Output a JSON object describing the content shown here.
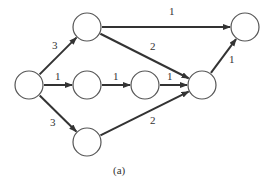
{
  "caption": "(a)",
  "nodes": [
    {
      "id": "S",
      "cx": 29,
      "cy": 85
    },
    {
      "id": "A",
      "cx": 87,
      "cy": 27
    },
    {
      "id": "B",
      "cx": 87,
      "cy": 85
    },
    {
      "id": "C",
      "cx": 145,
      "cy": 85
    },
    {
      "id": "D",
      "cx": 87,
      "cy": 142
    },
    {
      "id": "E",
      "cx": 202,
      "cy": 85
    },
    {
      "id": "F",
      "cx": 245,
      "cy": 27
    }
  ],
  "edges": [
    {
      "from": "S",
      "to": "A",
      "weight": "3"
    },
    {
      "from": "S",
      "to": "B",
      "weight": "1"
    },
    {
      "from": "S",
      "to": "D",
      "weight": "3"
    },
    {
      "from": "A",
      "to": "F",
      "weight": "1"
    },
    {
      "from": "A",
      "to": "E",
      "weight": "2"
    },
    {
      "from": "B",
      "to": "C",
      "weight": "1"
    },
    {
      "from": "C",
      "to": "E",
      "weight": "1"
    },
    {
      "from": "D",
      "to": "E",
      "weight": "2"
    },
    {
      "from": "E",
      "to": "F",
      "weight": "1"
    }
  ],
  "colors": {
    "stroke": "#333333",
    "node_stroke": "#555555",
    "background": "#ffffff"
  }
}
